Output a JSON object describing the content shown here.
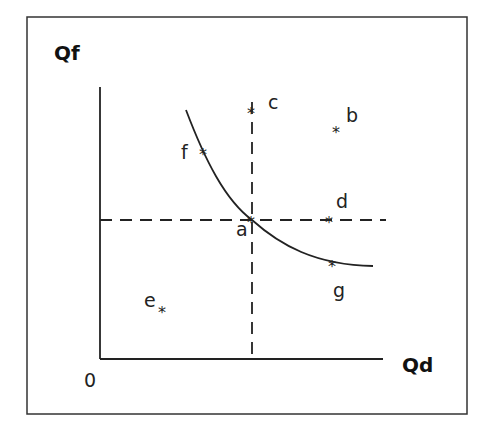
{
  "diagram": {
    "y_axis_label": "Qf",
    "x_axis_label": "Qd",
    "origin_label": "0",
    "points": [
      {
        "label": "a",
        "description": "intersection of curve and dashed lines"
      },
      {
        "label": "b",
        "description": "upper right, off curve"
      },
      {
        "label": "c",
        "description": "top of vertical dashed line"
      },
      {
        "label": "d",
        "description": "on horizontal dashed line, right"
      },
      {
        "label": "e",
        "description": "lower left region"
      },
      {
        "label": "f",
        "description": "on curve, upper left"
      },
      {
        "label": "g",
        "description": "on curve, lower right"
      }
    ],
    "colors": {
      "line": "#222222",
      "background": "#ffffff"
    }
  }
}
